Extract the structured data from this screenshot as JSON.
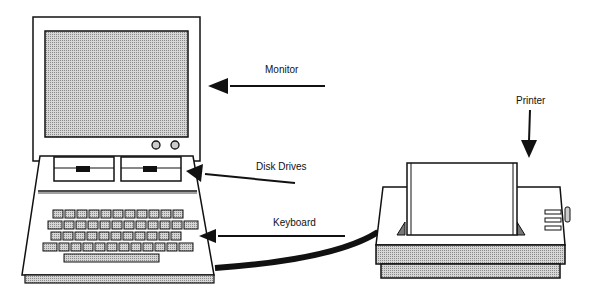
{
  "diagram": {
    "title": "",
    "labels": {
      "monitor": "Monitor",
      "disk_drives": "Disk Drives",
      "keyboard": "Keyboard",
      "printer": "Printer"
    },
    "colors": {
      "stroke": "#111111",
      "screen_fill": "#c4c4c4",
      "key_fill": "#bdbdbd",
      "base_fill": "#c8c8c8",
      "background": "#ffffff"
    },
    "keyboard_rows": [
      11,
      12,
      11,
      12
    ]
  }
}
